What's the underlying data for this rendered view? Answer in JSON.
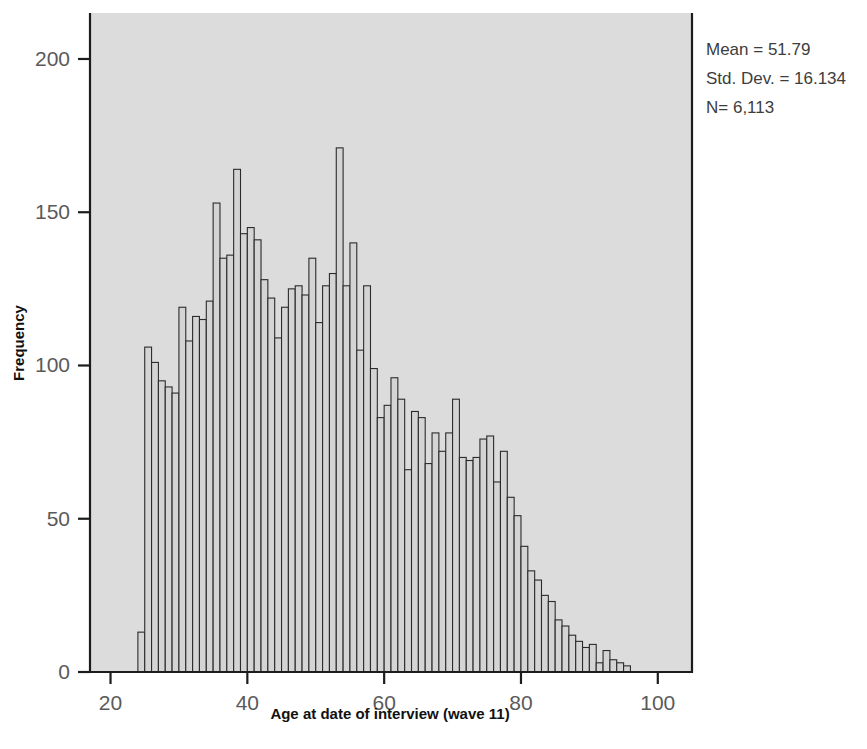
{
  "figure": {
    "background_color": "#ffffff",
    "plot_background_color": "#dcdcdc",
    "bar_fill_color": "#d4d4d4",
    "bar_edge_color": "#2b2b2b",
    "axis_color": "#1c1c1c",
    "tick_label_color": "#5a5a5a"
  },
  "annotations": {
    "mean_label": "Mean = 51.79",
    "std_dev_label": "Std. Dev. = 16.134",
    "n_label": "N= 6,113"
  },
  "chart_data": {
    "type": "bar",
    "title": "",
    "subtitle": "",
    "xlabel": "Age at date of interview (wave 11)",
    "ylabel": "Frequency",
    "xlim": [
      17,
      105
    ],
    "ylim": [
      0,
      215
    ],
    "xticks": [
      20,
      40,
      60,
      80,
      100
    ],
    "xticklabels": [
      "20",
      "40",
      "60",
      "80",
      "100"
    ],
    "yticks": [
      0,
      50,
      100,
      150,
      200
    ],
    "yticklabels": [
      "0",
      "50",
      "100",
      "150",
      "200"
    ],
    "grid": false,
    "legend": false,
    "bin_width": 1,
    "categories": [
      24,
      25,
      26,
      27,
      28,
      29,
      30,
      31,
      32,
      33,
      34,
      35,
      36,
      37,
      38,
      39,
      40,
      41,
      42,
      43,
      44,
      45,
      46,
      47,
      48,
      49,
      50,
      51,
      52,
      53,
      54,
      55,
      56,
      57,
      58,
      59,
      60,
      61,
      62,
      63,
      64,
      65,
      66,
      67,
      68,
      69,
      70,
      71,
      72,
      73,
      74,
      75,
      76,
      77,
      78,
      79,
      80,
      81,
      82,
      83,
      84,
      85,
      86,
      87,
      88,
      89,
      90,
      91,
      92,
      93,
      94,
      95
    ],
    "values": [
      13,
      106,
      101,
      95,
      93,
      91,
      119,
      108,
      116,
      115,
      121,
      153,
      135,
      136,
      164,
      143,
      145,
      141,
      128,
      122,
      109,
      119,
      125,
      126,
      123,
      135,
      114,
      126,
      130,
      171,
      126,
      140,
      105,
      126,
      99,
      83,
      87,
      96,
      89,
      66,
      85,
      83,
      68,
      78,
      72,
      78,
      89,
      70,
      69,
      70,
      76,
      77,
      62,
      72,
      57,
      51,
      41,
      33,
      30,
      25,
      23,
      17,
      15,
      12,
      10,
      8,
      9,
      3,
      7,
      4,
      3,
      2
    ],
    "x_unit": "years"
  }
}
